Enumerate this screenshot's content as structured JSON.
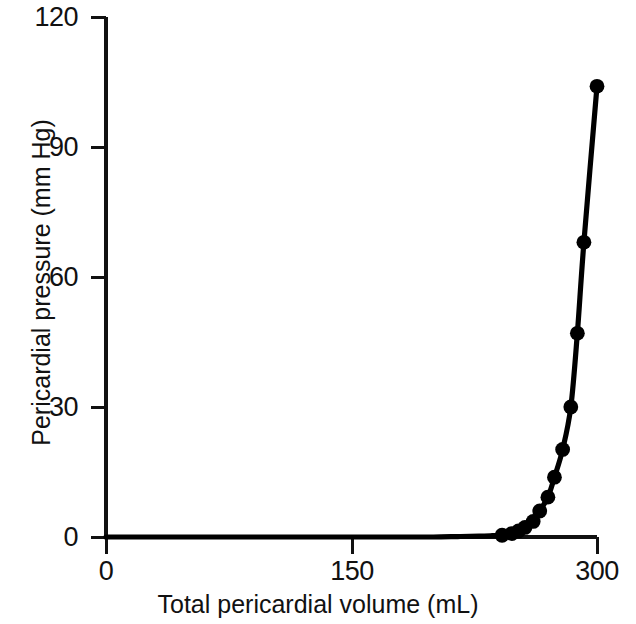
{
  "chart_data": {
    "type": "line",
    "title": "",
    "subtitle": "",
    "xlabel": "Total pericardial volume (mL)",
    "ylabel": "Pericardial pressure (mm Hg)",
    "xlim": [
      0,
      300
    ],
    "ylim": [
      0,
      120
    ],
    "xticks": [
      0,
      150,
      300
    ],
    "xticklabels": [
      "0",
      "150",
      "300"
    ],
    "yticks": [
      0,
      30,
      60,
      90,
      120
    ],
    "yticklabels": [
      "0",
      "30",
      "60",
      "90",
      "120"
    ],
    "grid": false,
    "legend": null,
    "legend_position": "none",
    "line_color": "#000000",
    "marker_color": "#000000",
    "marker_shape": "circle",
    "series": [
      {
        "name": "Pericardial pressure-volume relation",
        "x": [
          0,
          20,
          40,
          60,
          80,
          100,
          120,
          140,
          160,
          180,
          200,
          215,
          228,
          236,
          242,
          248,
          252,
          256,
          261,
          265,
          270,
          274,
          279,
          284,
          288,
          292,
          300
        ],
        "y": [
          0,
          0,
          0,
          0,
          0,
          0,
          0,
          0,
          0,
          0,
          0,
          0.1,
          0.2,
          0.3,
          0.4,
          0.8,
          1.4,
          2.2,
          3.6,
          6.0,
          9.2,
          13.8,
          20.2,
          30.0,
          47.0,
          68.0,
          104.0
        ],
        "marker_x": [
          242,
          248,
          252,
          256,
          261,
          265,
          270,
          274,
          279,
          284,
          288,
          292,
          300
        ],
        "marker_y": [
          0.4,
          0.8,
          1.4,
          2.2,
          3.6,
          6.0,
          9.2,
          13.8,
          20.2,
          30.0,
          47.0,
          68.0,
          104.0
        ]
      }
    ]
  },
  "axes": {
    "y_title": "Pericardial pressure (mm Hg)",
    "x_title": "Total pericardial volume (mL)",
    "y_labels": {
      "t0": "0",
      "t1": "30",
      "t2": "60",
      "t3": "90",
      "t4": "120"
    },
    "x_labels": {
      "t0": "0",
      "t1": "150",
      "t2": "300"
    }
  }
}
